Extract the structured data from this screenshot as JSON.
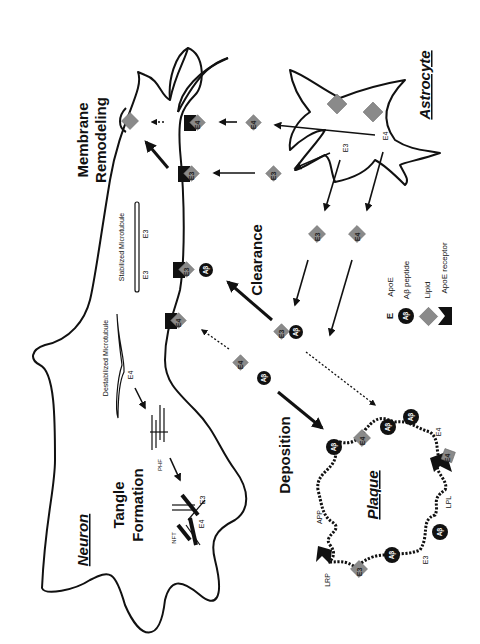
{
  "process_labels": {
    "membrane_remodeling_line1": "Membrane",
    "membrane_remodeling_line2": "Remodeling",
    "clearance": "Clearance",
    "deposition": "Deposition",
    "tangle_formation_line1": "Tangle",
    "tangle_formation_line2": "Formation"
  },
  "cells": {
    "neuron": "Neuron",
    "astrocyte": "Astrocyte",
    "plaque": "Plaque"
  },
  "microtubules": {
    "stabilized": "Stabilized Microtubule",
    "stabilized_e_left": "E3",
    "stabilized_e_right": "E3",
    "destabilized": "Destabilized Microtubule",
    "destabilized_e": "E4"
  },
  "tangle": {
    "phf": "PHF",
    "nft": "NFT",
    "e3": "E3",
    "e4": "E4"
  },
  "astrocyte_labels": {
    "e3": "E3",
    "e4": "E4"
  },
  "apoe_complexes": {
    "e3": "E3",
    "e4": "E4",
    "ab": "Aβ"
  },
  "plaque_labels": {
    "app": "APP",
    "lrp": "LRP",
    "lpl": "LPL",
    "e3": "E3",
    "e4": "E4"
  },
  "legend": {
    "items": [
      {
        "symbol": "E",
        "label": "ApoE"
      },
      {
        "symbol": "Aβ",
        "label": "Aβ peptide"
      },
      {
        "symbol": "lipid-diamond",
        "label": "Lipid"
      },
      {
        "symbol": "receptor-notch",
        "label": "ApoE receptor"
      }
    ]
  },
  "colors": {
    "line": "#111111",
    "lipid": "#8a8a8a",
    "background": "#ffffff"
  }
}
